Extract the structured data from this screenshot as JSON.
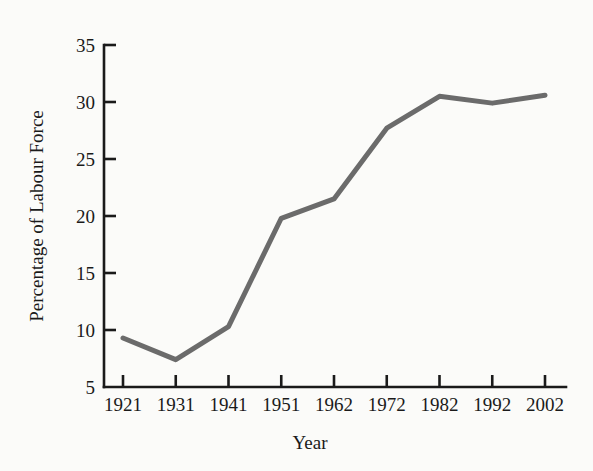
{
  "chart_data": {
    "type": "line",
    "title": "",
    "xlabel": "Year",
    "ylabel": "Percentage of Labour Force",
    "categories": [
      "1921",
      "1931",
      "1941",
      "1951",
      "1962",
      "1972",
      "1982",
      "1992",
      "2002"
    ],
    "values": [
      9.3,
      7.4,
      10.3,
      19.8,
      21.5,
      27.7,
      30.5,
      29.9,
      30.6
    ],
    "series": [
      {
        "name": "Percentage of Labour Force",
        "values": [
          9.3,
          7.4,
          10.3,
          19.8,
          21.5,
          27.7,
          30.5,
          29.9,
          30.6
        ]
      }
    ],
    "ylim": [
      5,
      35
    ],
    "y_ticks": [
      "5",
      "10",
      "15",
      "20",
      "25",
      "30",
      "35"
    ],
    "x_ticks": [
      "1921",
      "1931",
      "1941",
      "1951",
      "1962",
      "1972",
      "1982",
      "1992",
      "2002"
    ],
    "grid": false,
    "legend": "none",
    "line_color": "#6b6b6b",
    "axis_color": "#1a1a1a",
    "background_color": "#fbfbf9"
  }
}
